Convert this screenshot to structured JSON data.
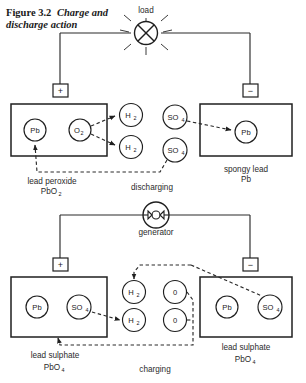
{
  "figure": {
    "number": "Figure 3.2",
    "title": "Charge and",
    "title_line2": "discharge action"
  },
  "top_circuit": {
    "name": "discharging",
    "load_label": "load",
    "load_icon": "lamp-icon",
    "positive_terminal": "+",
    "negative_terminal": "−",
    "left_plate": {
      "caption_line1": "lead peroxide",
      "caption_line2": "PbO",
      "caption_sub": "2",
      "ions": [
        {
          "label": "Pb",
          "sub": ""
        },
        {
          "label": "O",
          "sub": "2"
        }
      ]
    },
    "right_plate": {
      "caption_line1": "spongy lead",
      "caption_line2": "Pb",
      "ions": [
        {
          "label": "Pb",
          "sub": ""
        }
      ]
    },
    "electrolyte_ions": [
      {
        "label": "H",
        "sub": "2"
      },
      {
        "label": "H",
        "sub": "2"
      },
      {
        "label": "SO",
        "sub": "4"
      },
      {
        "label": "SO",
        "sub": "4"
      }
    ]
  },
  "bottom_circuit": {
    "name": "charging",
    "source_label": "generator",
    "source_icon": "generator-icon",
    "positive_terminal": "+",
    "negative_terminal": "−",
    "left_plate": {
      "caption_line1": "lead sulphate",
      "caption_line2": "PbO",
      "caption_sub": "4",
      "ions": [
        {
          "label": "Pb",
          "sub": ""
        },
        {
          "label": "SO",
          "sub": "4"
        }
      ]
    },
    "right_plate": {
      "caption_line1": "lead sulphate",
      "caption_line2": "PbO",
      "caption_sub": "4",
      "ions": [
        {
          "label": "Pb",
          "sub": ""
        },
        {
          "label": "SO",
          "sub": "4"
        }
      ]
    },
    "electrolyte_ions": [
      {
        "label": "H",
        "sub": "2"
      },
      {
        "label": "H",
        "sub": "2"
      },
      {
        "label": "0",
        "sub": ""
      },
      {
        "label": "0",
        "sub": ""
      }
    ]
  },
  "colors": {
    "ink": "#1f1f1f",
    "wire": "#2a2a2a",
    "text": "#2b2b2b",
    "background": "#ffffff"
  }
}
